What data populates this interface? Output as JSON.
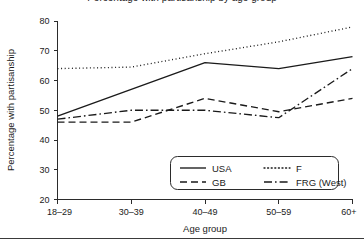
{
  "figure": {
    "title_cropped": "Percentage with partisanship by age group",
    "bottom_rule": "horizontal-rule"
  },
  "chart_data": {
    "type": "line",
    "title": "",
    "xlabel": "Age group",
    "ylabel": "Percentage with partisanship",
    "categories": [
      "18–29",
      "30–39",
      "40–49",
      "50–59",
      "60+"
    ],
    "ylim": [
      20,
      80
    ],
    "yticks": [
      20,
      30,
      40,
      50,
      60,
      70,
      80
    ],
    "ytick_labels": [
      "20",
      "30",
      "40",
      "50",
      "60",
      "70",
      "80"
    ],
    "grid": false,
    "legend_position": "lower-right",
    "series": [
      {
        "name": "USA",
        "style": "solid",
        "dash": "none",
        "values": [
          48,
          57,
          66,
          64,
          68
        ]
      },
      {
        "name": "F",
        "style": "dotted",
        "dash": "1,2.6",
        "values": [
          64,
          64.5,
          69,
          73,
          78
        ]
      },
      {
        "name": "GB",
        "style": "dashed",
        "dash": "7,4",
        "values": [
          46,
          46,
          54,
          49.5,
          54
        ]
      },
      {
        "name": "FRG (West)",
        "style": "dash-dot",
        "dash": "8,3,1.6,3",
        "values": [
          47,
          50,
          50,
          47.5,
          64
        ]
      }
    ]
  },
  "legend": {
    "entries": [
      {
        "label": "USA",
        "dash": "none"
      },
      {
        "label": "F",
        "dash": "1,2.6"
      },
      {
        "label": "GB",
        "dash": "7,4"
      },
      {
        "label": "FRG (West)",
        "dash": "8,3,1.6,3"
      }
    ]
  },
  "colors": {
    "line": "#1a1a1a",
    "axis": "#2b2b2b",
    "background": "#ffffff",
    "rule": "#3a3a3a"
  }
}
